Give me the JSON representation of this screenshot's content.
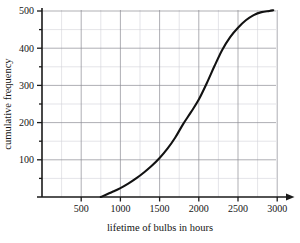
{
  "chart_data": {
    "type": "line",
    "title": "",
    "subtitle": "",
    "xlabel": "lifetime of bulbs in hours",
    "ylabel": "cumulative frequency",
    "xlim": [
      0,
      3400
    ],
    "ylim": [
      0,
      520
    ],
    "grid": "major and minor gridlines, both axes",
    "legend": "none",
    "x_ticks": [
      500,
      1000,
      1500,
      2000,
      2500,
      3000
    ],
    "x_tick_labels": [
      "500",
      "1000",
      "1500",
      "2000",
      "2500",
      "3000"
    ],
    "x_minor_step": 250,
    "y_ticks": [
      100,
      200,
      300,
      400,
      500
    ],
    "y_tick_labels": [
      "100",
      "200",
      "300",
      "400",
      "500"
    ],
    "y_minor_step": 50,
    "x_axis_arrow": true,
    "series": [
      {
        "name": "cumulative frequency of bulb lifetimes",
        "x": [
          750,
          900,
          1000,
          1100,
          1200,
          1300,
          1400,
          1500,
          1600,
          1700,
          1800,
          1900,
          2000,
          2100,
          2200,
          2300,
          2400,
          2500,
          2600,
          2700,
          2800,
          2900,
          2950
        ],
        "y": [
          0,
          14,
          24,
          36,
          50,
          66,
          84,
          105,
          130,
          160,
          196,
          228,
          262,
          305,
          352,
          396,
          430,
          455,
          475,
          489,
          497,
          500,
          502
        ]
      }
    ]
  },
  "axis": {
    "xlabel": "lifetime of bulbs in hours",
    "ylabel": "cumulative frequency"
  }
}
